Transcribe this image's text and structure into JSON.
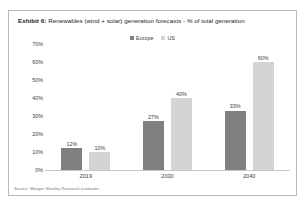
{
  "exhibit": {
    "label": "Exhibit 6:",
    "title": "Renewables (wind + solar) generation forecasts - % of total generation",
    "source": "Source: Morgan Stanley Research estimates"
  },
  "colors": {
    "europe": "#808080",
    "us": "#d4d4d4",
    "frame": "#b9b9b9",
    "axis": "#c8c8c8",
    "text": "#3c3c3c"
  },
  "chart_data": {
    "type": "bar",
    "title": "Renewables (wind + solar) generation forecasts - % of total generation",
    "xlabel": "",
    "ylabel": "",
    "categories": [
      "2019",
      "2030",
      "2040"
    ],
    "series": [
      {
        "name": "Europe",
        "color": "#808080",
        "values": [
          12,
          27,
          33
        ],
        "labels": [
          "12%",
          "27%",
          "33%"
        ]
      },
      {
        "name": "US",
        "color": "#d4d4d4",
        "values": [
          10,
          40,
          60
        ],
        "labels": [
          "10%",
          "40%",
          "60%"
        ]
      }
    ],
    "ylim": [
      0,
      70
    ],
    "yticks": [
      70,
      60,
      50,
      40,
      30,
      20,
      10,
      0
    ],
    "yticklabels": [
      "70%",
      "60%",
      "50%",
      "40%",
      "30%",
      "20%",
      "10%",
      "0%"
    ],
    "grid": false,
    "legend_position": "top-center",
    "legend": [
      "Europe",
      "US"
    ]
  }
}
